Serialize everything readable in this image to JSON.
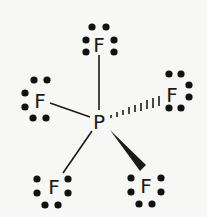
{
  "molecule": {
    "formula": "PF5",
    "central_atom": {
      "symbol": "P",
      "x": 99,
      "y": 121
    },
    "ligands": [
      {
        "id": "top",
        "symbol": "F",
        "x": 99,
        "y": 44,
        "bond": "single",
        "lone_pair_dots": [
          [
            92,
            27
          ],
          [
            106,
            27
          ],
          [
            86,
            40
          ],
          [
            114,
            40
          ],
          [
            86,
            52
          ],
          [
            114,
            52
          ]
        ]
      },
      {
        "id": "left",
        "symbol": "F",
        "x": 40,
        "y": 100,
        "bond": "single",
        "lone_pair_dots": [
          [
            34,
            80
          ],
          [
            47,
            80
          ],
          [
            25,
            93
          ],
          [
            25,
            107
          ],
          [
            33,
            118
          ],
          [
            46,
            118
          ]
        ]
      },
      {
        "id": "right",
        "symbol": "F",
        "x": 172,
        "y": 94,
        "bond": "hashed-wedge",
        "lone_pair_dots": [
          [
            169,
            74
          ],
          [
            181,
            74
          ],
          [
            189,
            85
          ],
          [
            189,
            97
          ],
          [
            169,
            108
          ],
          [
            181,
            108
          ]
        ]
      },
      {
        "id": "bottom-left",
        "symbol": "F",
        "x": 54,
        "y": 186,
        "bond": "single",
        "lone_pair_dots": [
          [
            37,
            179
          ],
          [
            37,
            193
          ],
          [
            68,
            179
          ],
          [
            68,
            193
          ],
          [
            45,
            205
          ],
          [
            58,
            205
          ]
        ]
      },
      {
        "id": "bottom-right",
        "symbol": "F",
        "x": 146,
        "y": 185,
        "bond": "solid-wedge",
        "lone_pair_dots": [
          [
            131,
            178
          ],
          [
            131,
            192
          ],
          [
            161,
            178
          ],
          [
            161,
            192
          ],
          [
            139,
            204
          ],
          [
            152,
            204
          ]
        ]
      }
    ]
  },
  "labels": {
    "P": "P",
    "F_top": "F",
    "F_left": "F",
    "F_right": "F",
    "F_bottom_left": "F",
    "F_bottom_right": "F"
  }
}
